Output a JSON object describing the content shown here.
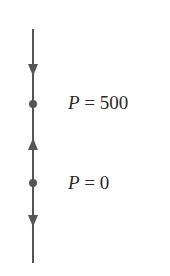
{
  "diagram": {
    "type": "phase-line",
    "line_color": "#555555",
    "equilibria": [
      {
        "variable": "P",
        "equals": "=",
        "value": "500",
        "text": "P = 500"
      },
      {
        "variable": "P",
        "equals": "=",
        "value": "0",
        "text": "P = 0"
      }
    ],
    "arrows": [
      {
        "position": "above P = 500",
        "direction": "down"
      },
      {
        "position": "between P = 0 and P = 500",
        "direction": "up"
      },
      {
        "position": "below P = 0",
        "direction": "down"
      }
    ]
  }
}
